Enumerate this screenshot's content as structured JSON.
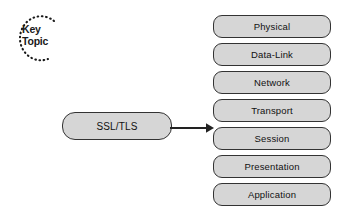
{
  "diagram": {
    "background_color": "#ffffff",
    "node_fill_color": "#d6d6d6",
    "node_border_color": "#333333",
    "text_color": "#111111"
  },
  "key_topic_badge": {
    "line1": "Key",
    "line2": "Topic",
    "style": "dotted-arc"
  },
  "protocol": {
    "label": "SSL/TLS"
  },
  "connector": {
    "type": "arrow",
    "direction": "right",
    "from": "SSL/TLS",
    "to": "OSI layer stack"
  },
  "osi_stack": {
    "layers": [
      {
        "label": "Physical"
      },
      {
        "label": "Data-Link"
      },
      {
        "label": "Network"
      },
      {
        "label": "Transport"
      },
      {
        "label": "Session"
      },
      {
        "label": "Presentation"
      },
      {
        "label": "Application"
      }
    ]
  }
}
